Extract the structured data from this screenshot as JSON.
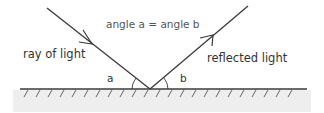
{
  "diagram": {
    "title": "angle a = angle b",
    "incident_label": "ray of light",
    "reflected_label": "reflected light",
    "angle_a_label": "a",
    "angle_b_label": "b",
    "colors": {
      "line": "#3a3a3a",
      "surface_fill": "#eeeeee",
      "text": "#333333",
      "title_text": "#555555"
    }
  }
}
